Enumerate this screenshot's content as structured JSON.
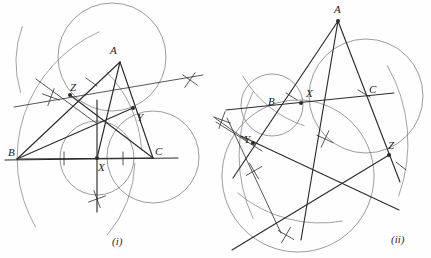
{
  "figure": {
    "background_color": "#fefefe",
    "ink_color": "#2b2b2b",
    "arc_color": "#7a7a7a",
    "width": 431,
    "height": 258
  },
  "panels": [
    {
      "id": "panel-i",
      "caption": "(i)",
      "caption_pos": {
        "x": 112,
        "y": 236
      },
      "vertices": [
        {
          "label": "A",
          "x": 120,
          "y": 62,
          "label_x": 110,
          "label_y": 45,
          "dot": false
        },
        {
          "label": "B",
          "x": 17,
          "y": 159,
          "label_x": 8,
          "label_y": 147,
          "dot": false
        },
        {
          "label": "C",
          "x": 153,
          "y": 158,
          "label_x": 155,
          "label_y": 146,
          "dot": false
        }
      ],
      "marked_points": [
        {
          "label": "X",
          "x": 97,
          "y": 158,
          "label_x": 98,
          "label_y": 162,
          "dot": true
        },
        {
          "label": "Y",
          "x": 133,
          "y": 108,
          "label_x": 137,
          "label_y": 112,
          "dot": true
        },
        {
          "label": "Z",
          "x": 70,
          "y": 95,
          "label_x": 70,
          "label_y": 82,
          "dot": true
        }
      ],
      "circles": [
        {
          "name": "circle-upper",
          "cx": 112,
          "cy": 57,
          "r": 54
        },
        {
          "name": "circle-right",
          "cx": 153,
          "cy": 157,
          "r": 46
        },
        {
          "name": "circle-lower",
          "cx": 97,
          "cy": 158,
          "r": 37
        }
      ],
      "arcs": [
        {
          "name": "arc-long-left",
          "cx": 155,
          "cy": 158,
          "r": 138,
          "a0": 150,
          "a1": 246
        },
        {
          "name": "arc-bz-upper",
          "cx": 120,
          "cy": 62,
          "r": 104,
          "a0": 163,
          "a1": 200
        },
        {
          "name": "arc-mid-right",
          "cx": 17,
          "cy": 159,
          "r": 125,
          "a0": 316,
          "a1": 356
        },
        {
          "name": "arc-mid-low",
          "cx": 17,
          "cy": 159,
          "r": 118,
          "a0": 2,
          "a1": 40
        }
      ],
      "segments": [
        {
          "name": "side-AB",
          "x1": 120,
          "y1": 62,
          "x2": 17,
          "y2": 159
        },
        {
          "name": "side-BC",
          "x1": 17,
          "y1": 159,
          "x2": 153,
          "y2": 158
        },
        {
          "name": "side-CA",
          "x1": 153,
          "y1": 158,
          "x2": 120,
          "y2": 62
        },
        {
          "name": "cevian-AX",
          "x1": 120,
          "y1": 62,
          "x2": 97,
          "y2": 158
        },
        {
          "name": "cevian-BY",
          "x1": 17,
          "y1": 159,
          "x2": 133,
          "y2": 108
        },
        {
          "name": "cevian-CZ",
          "x1": 153,
          "y1": 158,
          "x2": 70,
          "y2": 95
        },
        {
          "name": "ray-through-Z",
          "x1": 36,
          "y1": 79,
          "x2": 96,
          "y2": 123
        },
        {
          "name": "ray-ZY-extended",
          "x1": 14,
          "y1": 107,
          "x2": 203,
          "y2": 75
        },
        {
          "name": "baseline-extended",
          "x1": 5,
          "y1": 160,
          "x2": 178,
          "y2": 158
        },
        {
          "name": "perp-at-X",
          "x1": 97,
          "y1": 100,
          "x2": 97,
          "y2": 212
        },
        {
          "name": "tick-mark-BX",
          "x1": 64,
          "y1": 152,
          "x2": 64,
          "y2": 165
        },
        {
          "name": "tick-mark-XC",
          "x1": 123,
          "y1": 152,
          "x2": 123,
          "y2": 165
        },
        {
          "name": "tick-mark-AZ",
          "x1": 86,
          "y1": 78,
          "x2": 97,
          "y2": 86
        }
      ],
      "cross_marks": [
        {
          "name": "cross-left-upper",
          "x": 51,
          "y": 97,
          "a": 20
        },
        {
          "name": "cross-right-upper",
          "x": 190,
          "y": 80,
          "a": 35
        },
        {
          "name": "cross-bottom",
          "x": 97,
          "y": 199,
          "a": 70
        }
      ]
    },
    {
      "id": "panel-ii",
      "caption": "(ii)",
      "caption_pos": {
        "x": 391,
        "y": 234
      },
      "vertices": [
        {
          "label": "A",
          "x": 338,
          "y": 21,
          "label_x": 334,
          "label_y": 4,
          "dot": true
        },
        {
          "label": "B",
          "x": 282,
          "y": 104,
          "label_x": 268,
          "label_y": 96,
          "dot": false
        },
        {
          "label": "C",
          "x": 371,
          "y": 99,
          "label_x": 369,
          "label_y": 84,
          "dot": false
        }
      ],
      "marked_points": [
        {
          "label": "X",
          "x": 301,
          "y": 103,
          "label_x": 306,
          "label_y": 88,
          "dot": true
        },
        {
          "label": "Y",
          "x": 253,
          "y": 143,
          "label_x": 244,
          "label_y": 134,
          "dot": true
        },
        {
          "label": "Z",
          "x": 389,
          "y": 155,
          "label_x": 388,
          "label_y": 140,
          "dot": true
        }
      ],
      "circles": [
        {
          "name": "circle-small-left",
          "cx": 272,
          "cy": 105,
          "r": 31
        },
        {
          "name": "circle-big-right",
          "cx": 366,
          "cy": 96,
          "r": 57
        },
        {
          "name": "circle-big-lower",
          "cx": 298,
          "cy": 176,
          "r": 76
        }
      ],
      "arcs": [
        {
          "name": "arc-upper-left",
          "cx": 338,
          "cy": 21,
          "r": 110,
          "a0": 108,
          "a1": 150
        },
        {
          "name": "arc-right-low",
          "cx": 253,
          "cy": 143,
          "r": 155,
          "a0": 330,
          "a1": 20
        },
        {
          "name": "arc-y-sweep",
          "cx": 389,
          "cy": 155,
          "r": 150,
          "a0": 155,
          "a1": 205
        },
        {
          "name": "arc-bottom",
          "cx": 320,
          "cy": 95,
          "r": 128,
          "a0": 80,
          "a1": 130
        }
      ],
      "segments": [
        {
          "name": "side-AB-ext",
          "x1": 338,
          "y1": 21,
          "x2": 233,
          "y2": 178
        },
        {
          "name": "side-AC-ext",
          "x1": 338,
          "y1": 21,
          "x2": 400,
          "y2": 182
        },
        {
          "name": "line-BXC",
          "x1": 226,
          "y1": 110,
          "x2": 394,
          "y2": 93
        },
        {
          "name": "cevian-AX",
          "x1": 338,
          "y1": 21,
          "x2": 301,
          "y2": 240
        },
        {
          "name": "cevian-from-Y",
          "x1": 241,
          "y1": 136,
          "x2": 399,
          "y2": 210
        },
        {
          "name": "cevian-from-Z",
          "x1": 389,
          "y1": 155,
          "x2": 232,
          "y2": 250
        },
        {
          "name": "ray-Y-left",
          "x1": 216,
          "y1": 122,
          "x2": 262,
          "y2": 151
        },
        {
          "name": "ray-Y-down",
          "x1": 227,
          "y1": 118,
          "x2": 281,
          "y2": 233
        },
        {
          "name": "short-ray-left",
          "x1": 215,
          "y1": 118,
          "x2": 246,
          "y2": 140
        },
        {
          "name": "tick-near-B",
          "x1": 286,
          "y1": 93,
          "x2": 297,
          "y2": 100
        },
        {
          "name": "tick-near-C",
          "x1": 358,
          "y1": 90,
          "x2": 370,
          "y2": 97
        },
        {
          "name": "tick-near-Z",
          "x1": 396,
          "y1": 162,
          "x2": 406,
          "y2": 170
        }
      ],
      "cross_marks": [
        {
          "name": "cross-left-edge",
          "x": 222,
          "y": 120,
          "a": 20
        },
        {
          "name": "cross-mid",
          "x": 325,
          "y": 139,
          "a": 25
        },
        {
          "name": "cross-lower-left",
          "x": 286,
          "y": 235,
          "a": 30
        },
        {
          "name": "cross-under-B",
          "x": 254,
          "y": 171,
          "a": 60
        }
      ]
    }
  ]
}
